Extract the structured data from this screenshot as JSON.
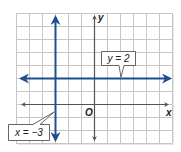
{
  "figure": {
    "type": "coordinate-plane",
    "grid": {
      "x_min": -6,
      "x_max": 6,
      "y_min": -3,
      "y_max": 7,
      "unit_px": 13,
      "origin_px": [
        94,
        104
      ],
      "grid_color": "#c6c6c6",
      "axis_color": "#555555",
      "shadow_color": "#e4e4e4"
    },
    "axes": {
      "x_label": "x",
      "y_label": "y",
      "origin_label": "O"
    },
    "lines": [
      {
        "id": "vertical",
        "equation": "x = −3",
        "x": -3,
        "color": "#1f4e8c"
      },
      {
        "id": "horizontal",
        "equation": "y = 2",
        "y": 2,
        "color": "#1f4e8c"
      }
    ],
    "callouts": {
      "horizontal": {
        "text": "y = 2"
      },
      "vertical": {
        "text": "x = −3"
      }
    }
  }
}
